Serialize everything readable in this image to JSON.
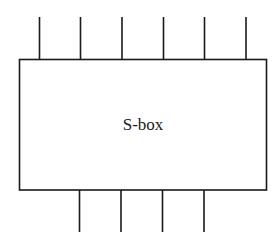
{
  "diagram": {
    "box_label": "S-box",
    "inputs": 6,
    "outputs": 4,
    "stroke_color": "#1a1a1a",
    "background": "#ffffff"
  }
}
